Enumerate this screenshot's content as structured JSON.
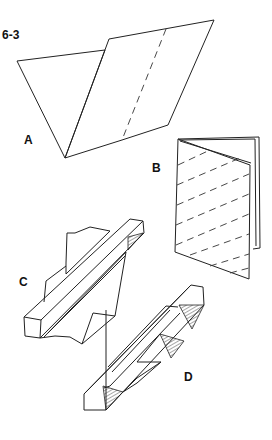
{
  "figure": {
    "number": "6-3",
    "panels": [
      {
        "id": "A",
        "label": "A",
        "description": "sheet folded in half, with dashed fold line"
      },
      {
        "id": "B",
        "label": "B",
        "description": "folded booklet with dashed diagonal lines"
      },
      {
        "id": "C",
        "label": "C",
        "description": "folded pleated strip with a triangular fold"
      },
      {
        "id": "D",
        "label": "D",
        "description": "strip pleated into triangular prisms with hatched faces"
      }
    ]
  }
}
